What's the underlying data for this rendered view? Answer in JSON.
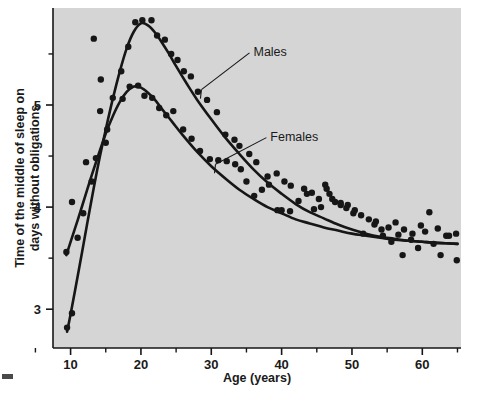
{
  "figure": {
    "background_color": "#ffffff",
    "plot_background_color": "#d5d5d5",
    "ink_color": "#161616"
  },
  "chart_data": {
    "type": "scatter",
    "title": "",
    "subtitle": "",
    "xlabel": "Age (years)",
    "ylabel": "Time of the middle of sleep on days without obligations",
    "ylabel_line1": "Time of the middle of sleep on",
    "ylabel_line2": "days without obligations",
    "xlim": [
      7.5,
      65.5
    ],
    "ylim": [
      2.62,
      5.95
    ],
    "xticks": [
      10,
      20,
      30,
      40,
      50,
      60
    ],
    "xticklabels": [
      "10",
      "20",
      "30",
      "40",
      "50",
      "60"
    ],
    "xminorticks": [
      5,
      15,
      25,
      35,
      45,
      55,
      65
    ],
    "yticks": [
      3,
      4,
      5
    ],
    "yticklabels": [
      "3",
      "4",
      "5"
    ],
    "yminorticks": [
      3.5,
      4.5,
      5.5
    ],
    "grid": false,
    "legend_position": "inline-annotations",
    "annotations": [
      {
        "text": "Males",
        "x": 36.0,
        "y": 5.53,
        "leader_to_x": 28.6,
        "leader_to_y": 5.15
      },
      {
        "text": "Females",
        "x": 38.4,
        "y": 4.7,
        "leader_to_x": 30.6,
        "leader_to_y": 4.42
      }
    ],
    "series": [
      {
        "name": "Males",
        "marker": "filled-circle",
        "color": "#161616",
        "fit_curve": [
          {
            "x": 9.5,
            "y": 2.78
          },
          {
            "x": 10.0,
            "y": 2.95
          },
          {
            "x": 11.0,
            "y": 3.32
          },
          {
            "x": 12.0,
            "y": 3.7
          },
          {
            "x": 13.0,
            "y": 4.08
          },
          {
            "x": 14.0,
            "y": 4.44
          },
          {
            "x": 15.0,
            "y": 4.76
          },
          {
            "x": 16.0,
            "y": 5.06
          },
          {
            "x": 17.0,
            "y": 5.33
          },
          {
            "x": 18.0,
            "y": 5.56
          },
          {
            "x": 19.0,
            "y": 5.72
          },
          {
            "x": 20.0,
            "y": 5.8
          },
          {
            "x": 21.0,
            "y": 5.78
          },
          {
            "x": 22.0,
            "y": 5.71
          },
          {
            "x": 23.0,
            "y": 5.61
          },
          {
            "x": 24.0,
            "y": 5.5
          },
          {
            "x": 25.0,
            "y": 5.38
          },
          {
            "x": 26.5,
            "y": 5.21
          },
          {
            "x": 28.0,
            "y": 5.05
          },
          {
            "x": 30.0,
            "y": 4.86
          },
          {
            "x": 32.0,
            "y": 4.68
          },
          {
            "x": 34.0,
            "y": 4.52
          },
          {
            "x": 36.0,
            "y": 4.37
          },
          {
            "x": 38.0,
            "y": 4.24
          },
          {
            "x": 40.0,
            "y": 4.13
          },
          {
            "x": 42.0,
            "y": 4.03
          },
          {
            "x": 44.0,
            "y": 3.95
          },
          {
            "x": 46.0,
            "y": 3.89
          },
          {
            "x": 48.0,
            "y": 3.83
          },
          {
            "x": 50.0,
            "y": 3.78
          },
          {
            "x": 52.0,
            "y": 3.74
          },
          {
            "x": 54.0,
            "y": 3.71
          },
          {
            "x": 56.0,
            "y": 3.69
          },
          {
            "x": 58.0,
            "y": 3.67
          },
          {
            "x": 60.0,
            "y": 3.66
          },
          {
            "x": 62.0,
            "y": 3.65
          },
          {
            "x": 65.0,
            "y": 3.64
          }
        ],
        "points": [
          {
            "x": 9.5,
            "y": 2.82
          },
          {
            "x": 10.2,
            "y": 2.96
          },
          {
            "x": 13.3,
            "y": 5.65
          },
          {
            "x": 14.2,
            "y": 4.94
          },
          {
            "x": 15.2,
            "y": 4.76
          },
          {
            "x": 16.0,
            "y": 5.07
          },
          {
            "x": 17.2,
            "y": 5.33
          },
          {
            "x": 18.2,
            "y": 5.57
          },
          {
            "x": 19.2,
            "y": 5.81
          },
          {
            "x": 20.2,
            "y": 5.83
          },
          {
            "x": 21.5,
            "y": 5.83
          },
          {
            "x": 22.3,
            "y": 5.68
          },
          {
            "x": 23.4,
            "y": 5.64
          },
          {
            "x": 24.3,
            "y": 5.5
          },
          {
            "x": 25.2,
            "y": 5.44
          },
          {
            "x": 26.1,
            "y": 5.33
          },
          {
            "x": 27.1,
            "y": 5.28
          },
          {
            "x": 28.1,
            "y": 5.13
          },
          {
            "x": 29.4,
            "y": 5.05
          },
          {
            "x": 30.8,
            "y": 4.93
          },
          {
            "x": 32.0,
            "y": 4.71
          },
          {
            "x": 33.3,
            "y": 4.66
          },
          {
            "x": 34.0,
            "y": 4.6
          },
          {
            "x": 35.4,
            "y": 4.52
          },
          {
            "x": 36.4,
            "y": 4.44
          },
          {
            "x": 38.0,
            "y": 4.3
          },
          {
            "x": 39.3,
            "y": 4.33
          },
          {
            "x": 40.4,
            "y": 4.25
          },
          {
            "x": 41.3,
            "y": 4.21
          },
          {
            "x": 43.2,
            "y": 4.18
          },
          {
            "x": 44.3,
            "y": 4.14
          },
          {
            "x": 45.3,
            "y": 4.08
          },
          {
            "x": 46.2,
            "y": 4.22
          },
          {
            "x": 46.8,
            "y": 4.13
          },
          {
            "x": 47.6,
            "y": 4.05
          },
          {
            "x": 48.4,
            "y": 4.02
          },
          {
            "x": 49.4,
            "y": 4.02
          },
          {
            "x": 50.2,
            "y": 3.94
          },
          {
            "x": 51.3,
            "y": 3.92
          },
          {
            "x": 52.4,
            "y": 3.88
          },
          {
            "x": 53.4,
            "y": 3.86
          },
          {
            "x": 54.2,
            "y": 3.78
          },
          {
            "x": 55.2,
            "y": 3.8
          },
          {
            "x": 56.2,
            "y": 3.85
          },
          {
            "x": 57.4,
            "y": 3.78
          },
          {
            "x": 58.6,
            "y": 3.74
          },
          {
            "x": 59.8,
            "y": 3.82
          },
          {
            "x": 61.0,
            "y": 3.95
          },
          {
            "x": 62.2,
            "y": 3.79
          },
          {
            "x": 63.4,
            "y": 3.72
          },
          {
            "x": 64.8,
            "y": 3.74
          }
        ]
      },
      {
        "name": "Females",
        "marker": "filled-circle",
        "color": "#161616",
        "fit_curve": [
          {
            "x": 9.4,
            "y": 3.53
          },
          {
            "x": 10.0,
            "y": 3.66
          },
          {
            "x": 11.0,
            "y": 3.87
          },
          {
            "x": 12.0,
            "y": 4.09
          },
          {
            "x": 13.0,
            "y": 4.31
          },
          {
            "x": 14.0,
            "y": 4.52
          },
          {
            "x": 15.0,
            "y": 4.72
          },
          {
            "x": 16.0,
            "y": 4.89
          },
          {
            "x": 17.0,
            "y": 5.03
          },
          {
            "x": 18.0,
            "y": 5.13
          },
          {
            "x": 19.0,
            "y": 5.18
          },
          {
            "x": 20.0,
            "y": 5.17
          },
          {
            "x": 21.0,
            "y": 5.12
          },
          {
            "x": 22.0,
            "y": 5.05
          },
          {
            "x": 23.0,
            "y": 4.96
          },
          {
            "x": 24.5,
            "y": 4.83
          },
          {
            "x": 26.0,
            "y": 4.7
          },
          {
            "x": 28.0,
            "y": 4.54
          },
          {
            "x": 30.0,
            "y": 4.4
          },
          {
            "x": 32.0,
            "y": 4.28
          },
          {
            "x": 34.0,
            "y": 4.17
          },
          {
            "x": 36.0,
            "y": 4.08
          },
          {
            "x": 38.0,
            "y": 4.0
          },
          {
            "x": 40.0,
            "y": 3.94
          },
          {
            "x": 42.0,
            "y": 3.88
          },
          {
            "x": 44.0,
            "y": 3.84
          },
          {
            "x": 46.0,
            "y": 3.8
          },
          {
            "x": 48.0,
            "y": 3.77
          },
          {
            "x": 50.0,
            "y": 3.74
          },
          {
            "x": 52.0,
            "y": 3.72
          },
          {
            "x": 54.0,
            "y": 3.7
          },
          {
            "x": 56.0,
            "y": 3.68
          },
          {
            "x": 58.0,
            "y": 3.67
          },
          {
            "x": 60.0,
            "y": 3.66
          },
          {
            "x": 62.0,
            "y": 3.65
          },
          {
            "x": 65.0,
            "y": 3.64
          }
        ],
        "points": [
          {
            "x": 9.4,
            "y": 3.56
          },
          {
            "x": 10.2,
            "y": 4.05
          },
          {
            "x": 11.0,
            "y": 3.7
          },
          {
            "x": 11.8,
            "y": 3.94
          },
          {
            "x": 12.2,
            "y": 4.44
          },
          {
            "x": 13.0,
            "y": 4.25
          },
          {
            "x": 13.6,
            "y": 4.48
          },
          {
            "x": 14.3,
            "y": 5.25
          },
          {
            "x": 15.0,
            "y": 4.63
          },
          {
            "x": 17.4,
            "y": 5.06
          },
          {
            "x": 18.4,
            "y": 5.18
          },
          {
            "x": 19.6,
            "y": 5.19
          },
          {
            "x": 20.5,
            "y": 5.09
          },
          {
            "x": 21.6,
            "y": 5.07
          },
          {
            "x": 22.6,
            "y": 4.97
          },
          {
            "x": 23.6,
            "y": 4.9
          },
          {
            "x": 24.6,
            "y": 4.94
          },
          {
            "x": 26.0,
            "y": 4.76
          },
          {
            "x": 27.2,
            "y": 4.67
          },
          {
            "x": 28.4,
            "y": 4.55
          },
          {
            "x": 29.8,
            "y": 4.47
          },
          {
            "x": 31.0,
            "y": 4.46
          },
          {
            "x": 32.2,
            "y": 4.45
          },
          {
            "x": 33.4,
            "y": 4.42
          },
          {
            "x": 34.2,
            "y": 4.37
          },
          {
            "x": 35.0,
            "y": 4.25
          },
          {
            "x": 36.1,
            "y": 4.11
          },
          {
            "x": 37.2,
            "y": 4.17
          },
          {
            "x": 38.2,
            "y": 4.22
          },
          {
            "x": 39.4,
            "y": 3.97
          },
          {
            "x": 40.0,
            "y": 3.97
          },
          {
            "x": 41.2,
            "y": 3.96
          },
          {
            "x": 42.4,
            "y": 4.06
          },
          {
            "x": 43.6,
            "y": 4.13
          },
          {
            "x": 44.6,
            "y": 3.98
          },
          {
            "x": 45.6,
            "y": 4.0
          },
          {
            "x": 46.4,
            "y": 4.18
          },
          {
            "x": 47.2,
            "y": 4.08
          },
          {
            "x": 48.4,
            "y": 4.04
          },
          {
            "x": 49.2,
            "y": 3.99
          },
          {
            "x": 50.4,
            "y": 3.97
          },
          {
            "x": 51.6,
            "y": 3.74
          },
          {
            "x": 53.2,
            "y": 3.83
          },
          {
            "x": 54.4,
            "y": 3.72
          },
          {
            "x": 55.6,
            "y": 3.66
          },
          {
            "x": 56.6,
            "y": 3.73
          },
          {
            "x": 57.2,
            "y": 3.53
          },
          {
            "x": 58.4,
            "y": 3.68
          },
          {
            "x": 59.4,
            "y": 3.6
          },
          {
            "x": 60.4,
            "y": 3.76
          },
          {
            "x": 61.6,
            "y": 3.64
          },
          {
            "x": 62.6,
            "y": 3.53
          },
          {
            "x": 63.8,
            "y": 3.72
          },
          {
            "x": 64.9,
            "y": 3.48
          }
        ]
      }
    ]
  }
}
